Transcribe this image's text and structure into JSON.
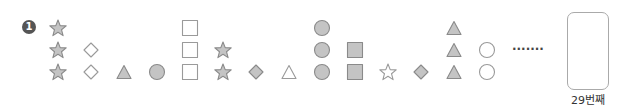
{
  "problem": {
    "number": "1",
    "ellipsis": "·······",
    "answer_box_label": "29번째",
    "colors": {
      "fill": "#c4c4c4",
      "stroke": "#8a8a8a",
      "outline_stroke": "#9a9a9a"
    }
  },
  "columns": [
    {
      "shape": "star",
      "filled": true,
      "count": 3
    },
    {
      "shape": "diamond",
      "filled": false,
      "count": 2
    },
    {
      "shape": "triangle",
      "filled": true,
      "count": 1
    },
    {
      "shape": "circle",
      "filled": true,
      "count": 1
    },
    {
      "shape": "square",
      "filled": false,
      "count": 3
    },
    {
      "shape": "star",
      "filled": true,
      "count": 2
    },
    {
      "shape": "diamond",
      "filled": true,
      "count": 1
    },
    {
      "shape": "triangle",
      "filled": false,
      "count": 1
    },
    {
      "shape": "circle",
      "filled": true,
      "count": 3
    },
    {
      "shape": "square",
      "filled": true,
      "count": 2
    },
    {
      "shape": "star",
      "filled": false,
      "count": 1
    },
    {
      "shape": "diamond",
      "filled": true,
      "count": 1
    },
    {
      "shape": "triangle",
      "filled": true,
      "count": 3
    },
    {
      "shape": "circle",
      "filled": false,
      "count": 2
    }
  ]
}
